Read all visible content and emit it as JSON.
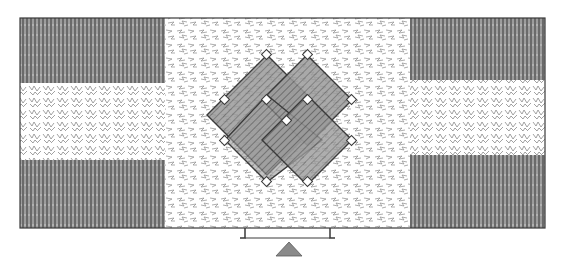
{
  "figure": {
    "kind": "line-drawing illustration",
    "colors": {
      "ink": "#3a3a3a",
      "dark_band": "#5a5a5a",
      "light_texture": "#8a8a8a",
      "paper": "#ffffff"
    },
    "panels": {
      "left": [
        "dark-hatched",
        "light-scribble",
        "dark-hatched"
      ],
      "center": "light-scribble with double diamond motif",
      "right": [
        "dark-hatched",
        "light-scribble",
        "dark-hatched"
      ]
    },
    "motif": {
      "shape": "two overlapping diamonds with small diamond knots at corners",
      "count": 2
    }
  }
}
